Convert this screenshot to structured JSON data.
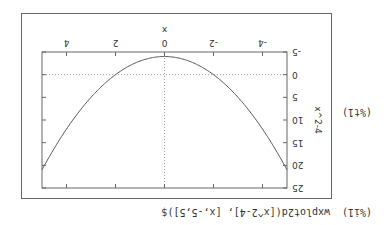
{
  "input_cell": {
    "prompt": "(%i1)",
    "command": "wxplot2d([x^2-4], [x,-5,5])$"
  },
  "output_cell": {
    "prompt": "(%t1)"
  },
  "chart_data": {
    "type": "line",
    "title": "",
    "xlabel": "x",
    "ylabel": "x^2-4",
    "xlim": [
      -5,
      5
    ],
    "ylim": [
      -5,
      25
    ],
    "xticks": [
      -4,
      -2,
      0,
      2,
      4
    ],
    "yticks": [
      -5,
      0,
      5,
      10,
      15,
      20,
      25
    ],
    "grid": "zero-axes dotted",
    "series": [
      {
        "name": "x^2-4",
        "x": [
          -5,
          -4,
          -3,
          -2,
          -1,
          0,
          1,
          2,
          3,
          4,
          5
        ],
        "values": [
          21,
          12,
          5,
          0,
          -3,
          -4,
          -3,
          0,
          5,
          12,
          21
        ]
      }
    ],
    "line_color": "#555555"
  },
  "labels": {
    "x_axis": "x",
    "y_axis": "x^2-4",
    "xtick_labels": [
      "-4",
      "-2",
      "0",
      "2",
      "4"
    ],
    "ytick_labels": [
      "-5",
      "0",
      "5",
      "10",
      "15",
      "20",
      "25"
    ]
  }
}
